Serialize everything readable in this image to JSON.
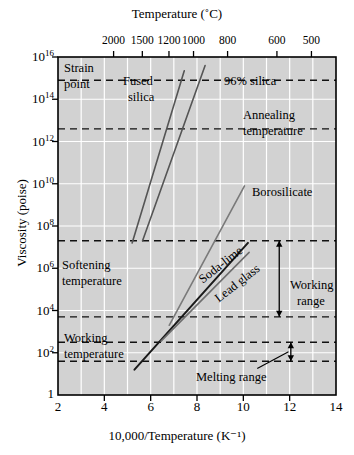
{
  "figure": {
    "top_axis_title": "Temperature (˚C)",
    "bottom_axis_title": "10,000/Temperature (K⁻¹)",
    "left_axis_title": "Viscosity (poise)",
    "background_color": "#d2d2d2",
    "grid_color": "#ffffff",
    "axis_color": "#000000"
  },
  "top_ticks": [
    {
      "label": "2000",
      "x": 4.4
    },
    {
      "label": "1500",
      "x": 5.64
    },
    {
      "label": "1200",
      "x": 6.79
    },
    {
      "label": "1000",
      "x": 7.85
    },
    {
      "label": "800",
      "x": 9.32
    },
    {
      "label": "600",
      "x": 11.45
    },
    {
      "label": "500",
      "x": 12.94
    }
  ],
  "bottom_ticks": [
    "2",
    "4",
    "6",
    "8",
    "10",
    "12",
    "14"
  ],
  "y_ticks": [
    {
      "mantissa": "10",
      "exponent": "16",
      "value": 16
    },
    {
      "mantissa": "10",
      "exponent": "14",
      "value": 14
    },
    {
      "mantissa": "10",
      "exponent": "12",
      "value": 12
    },
    {
      "mantissa": "10",
      "exponent": "10",
      "value": 10
    },
    {
      "mantissa": "10",
      "exponent": "8",
      "value": 8
    },
    {
      "mantissa": "10",
      "exponent": "6",
      "value": 6
    },
    {
      "mantissa": "10",
      "exponent": "4",
      "value": 4
    },
    {
      "mantissa": "10",
      "exponent": "2",
      "value": 2
    },
    {
      "mantissa": "1",
      "exponent": "",
      "value": 0
    }
  ],
  "reference_lines": [
    {
      "name": "strain-point",
      "label_line1": "Strain",
      "label_line2": "point",
      "y": 14.9
    },
    {
      "name": "annealing-temperature",
      "label_line1": "Annealing",
      "label_line2": "temperature",
      "y": 12.6
    },
    {
      "name": "softening-temperature",
      "label_line1": "Softening",
      "label_line2": "temperature",
      "y": 7.3
    },
    {
      "name": "working-temperature",
      "label_line1": "Working",
      "label_line2": "temperature",
      "y": 3.7
    },
    {
      "name": "melting-range-upper",
      "label_line1": "",
      "label_line2": "",
      "y": 2.5
    },
    {
      "name": "melting-range-lower",
      "label_line1": "",
      "label_line2": "",
      "y": 1.6
    }
  ],
  "annotations": [
    {
      "name": "working-range-label",
      "line1": "Working",
      "line2": "range"
    },
    {
      "name": "melting-range-label",
      "line1": "Melting range",
      "line2": ""
    }
  ],
  "chart_data": {
    "type": "line",
    "title": "",
    "xlabel": "10,000/Temperature (K⁻¹)",
    "ylabel": "Viscosity (poise)",
    "top_xlabel": "Temperature (˚C)",
    "xlim": [
      2,
      14
    ],
    "ylim_log10": [
      0,
      16
    ],
    "yscale": "log",
    "grid": true,
    "legend": "inline-labels",
    "series": [
      {
        "name": "Fused silica",
        "color": "#555555",
        "label_line1": "Fused",
        "label_line2": "silica",
        "points": [
          [
            5.2,
            7.2
          ],
          [
            7.45,
            15.35
          ]
        ]
      },
      {
        "name": "96% silica",
        "color": "#555555",
        "label_line1": "96% silica",
        "label_line2": "",
        "points": [
          [
            5.65,
            7.3
          ],
          [
            8.35,
            15.6
          ]
        ]
      },
      {
        "name": "Borosilicate",
        "color": "#7a7a7a",
        "label_line1": "Borosilicate",
        "label_line2": "",
        "points": [
          [
            6.8,
            3.3
          ],
          [
            10.05,
            9.9
          ]
        ]
      },
      {
        "name": "Soda-lime",
        "color": "#1a1a1a",
        "label_line1": "Soda-lime",
        "label_line2": "",
        "points": [
          [
            5.3,
            1.2
          ],
          [
            10.2,
            7.2
          ]
        ]
      },
      {
        "name": "Lead glass",
        "color": "#6e6e6e",
        "label_line1": "Lead glass",
        "label_line2": "",
        "points": [
          [
            6.45,
            2.55
          ],
          [
            10.25,
            6.75
          ]
        ]
      }
    ]
  }
}
